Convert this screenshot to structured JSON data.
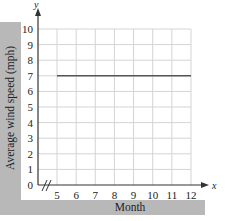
{
  "chart_data": {
    "type": "line",
    "title": "",
    "xlabel": "Month",
    "ylabel": "Average wind speed (mph)",
    "x_axis_var": "x",
    "y_axis_var": "y",
    "x_ticks": [
      5,
      6,
      7,
      8,
      9,
      10,
      11,
      12
    ],
    "y_ticks": [
      0,
      1,
      2,
      3,
      4,
      5,
      6,
      7,
      8,
      9,
      10
    ],
    "xlim": [
      5,
      12
    ],
    "ylim": [
      0,
      10
    ],
    "x_axis_break": true,
    "grid": true,
    "legend": null,
    "series": [
      {
        "name": "Average wind speed",
        "x": [
          5,
          12
        ],
        "values": [
          7,
          7
        ],
        "color": "#555555"
      }
    ]
  },
  "colors": {
    "label_bar": "#b8b8b8",
    "grid": "#d4d4d4",
    "axis": "#333333",
    "line": "#555555"
  }
}
